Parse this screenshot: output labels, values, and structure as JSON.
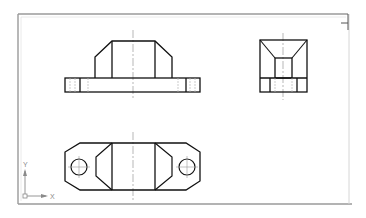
{
  "drawing": {
    "title": "Three-view orthographic drawing of bracket",
    "colors": {
      "background": "#ffffff",
      "border_outer": "#9a9a9a",
      "border_inner": "#d6d6d6",
      "object_line": "#111111",
      "centerline": "#9a9a9a",
      "hidden_line": "#b5b5b5",
      "ucs": "#8a8a8a"
    },
    "views": [
      {
        "name": "front-view",
        "label": "Front view"
      },
      {
        "name": "side-view",
        "label": "Right side view"
      },
      {
        "name": "top-view",
        "label": "Top view"
      }
    ],
    "ucs_icon": {
      "x_label": "X",
      "y_label": "Y"
    }
  }
}
